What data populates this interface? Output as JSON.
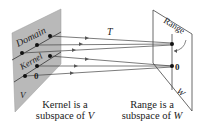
{
  "figure": {
    "map_label": "T",
    "domain_plane": {
      "name": "V",
      "label_domain": "Domain",
      "label_kernel": "Kernel",
      "zero_label": "0",
      "fill": "#b9b9b9"
    },
    "codomain_plane": {
      "name": "W",
      "label_range": "Range",
      "zero_label": "0",
      "fill": "#ffffff"
    },
    "captions": {
      "left_line1": "Kernel is a",
      "left_line2_prefix": "subspace of ",
      "left_line2_var": "V",
      "right_line1": "Range is a",
      "right_line2_prefix": "subspace of ",
      "right_line2_var": "W"
    },
    "colors": {
      "line": "#3a3a3a",
      "dot": "#111111",
      "arrow": "#555555"
    }
  }
}
